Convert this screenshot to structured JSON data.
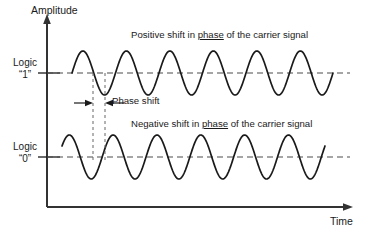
{
  "diagram": {
    "axes": {
      "y_label": "Amplitude",
      "x_label": "Time",
      "axis_color": "#333333",
      "origin_x": 47,
      "origin_y": 207
    },
    "levels": [
      {
        "name": "logic-one",
        "label_line1": "Logic",
        "label_line2": "“1”",
        "baseline_y": 73,
        "tick_label_value": "1"
      },
      {
        "name": "logic-zero",
        "label_line1": "Logic",
        "label_line2": "“0”",
        "baseline_y": 157,
        "tick_label_value": "0"
      }
    ],
    "captions": {
      "positive": {
        "before": "Positive shift in ",
        "underlined": "phase",
        "after": " of the carrier signal"
      },
      "negative": {
        "before": "Negative shift in ",
        "underlined": "phase",
        "after": " of the carrier signal"
      }
    },
    "annotation": {
      "label": "Phase shift",
      "marker_left_x": 93,
      "marker_right_x": 105,
      "arrow_y": 103
    },
    "colors": {
      "wave_stroke": "#1a1a1a",
      "dashed_guide": "#4d4d4d",
      "text": "#1a1a1a",
      "background": "#ffffff"
    }
  },
  "chart_data": {
    "type": "line",
    "xlabel": "Time",
    "ylabel": "Amplitude",
    "grid": false,
    "legend_position": "inline-annotations",
    "xlim": [
      47,
      368
    ],
    "ylim": [
      207,
      10
    ],
    "annotations": [
      "Positive shift in phase of the carrier signal",
      "Negative shift in phase of the carrier signal",
      "Phase shift"
    ],
    "series": [
      {
        "name": "Logic “1” carrier (positive phase shift)",
        "baseline": 73,
        "amplitude": 22,
        "cycles": 6,
        "start_x": 72,
        "end_x": 333,
        "phase_offset_deg": 0,
        "peaks": 6
      },
      {
        "name": "Logic “0” carrier (negative phase shift)",
        "baseline": 157,
        "amplitude": 22,
        "cycles": 6,
        "start_x": 62,
        "end_x": 325,
        "phase_offset_deg": 30,
        "peaks": 6
      }
    ],
    "reference_lines": [
      {
        "name": "logic-one-baseline",
        "y": 73,
        "style": "dashed",
        "x_from": 20,
        "x_to": 350
      },
      {
        "name": "logic-zero-baseline",
        "y": 157,
        "style": "dashed",
        "x_from": 20,
        "x_to": 350
      }
    ]
  }
}
